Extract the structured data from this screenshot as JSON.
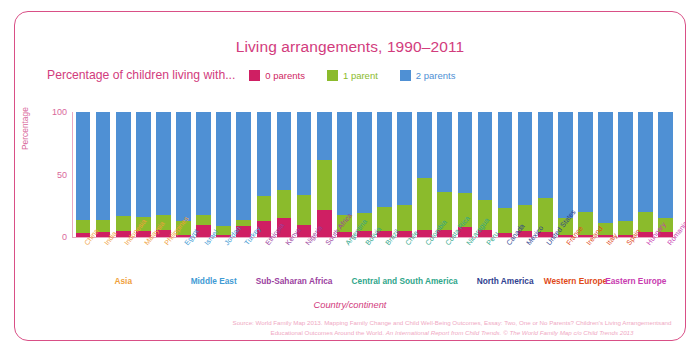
{
  "title": "Living arrangements, 1990–2011",
  "legend": {
    "label": "Percentage of children living with...",
    "items": [
      {
        "text": "0 parents",
        "color": "#cf1f63"
      },
      {
        "text": "1 parent",
        "color": "#8bbb2c"
      },
      {
        "text": "2 parents",
        "color": "#4f90d4"
      }
    ]
  },
  "axes": {
    "ylabel": "Percentage",
    "yticks": [
      "100",
      "50",
      "0"
    ],
    "xlabel": "Country/continent"
  },
  "groups": [
    {
      "label": "Asia",
      "color": "#f0a03c",
      "start": 0,
      "end": 4
    },
    {
      "label": "Middle East",
      "color": "#3f9bd4",
      "start": 5,
      "end": 8
    },
    {
      "label": "Sub-Saharan Africa",
      "color": "#9b3fa0",
      "start": 9,
      "end": 12
    },
    {
      "label": "Central and South America",
      "color": "#2fa68a",
      "start": 13,
      "end": 19
    },
    {
      "label": "North America",
      "color": "#2f3f8f",
      "start": 20,
      "end": 22
    },
    {
      "label": "Western Europe",
      "color": "#e04a18",
      "start": 23,
      "end": 26
    },
    {
      "label": "Eastern Europe",
      "color": "#c83cb0",
      "start": 27,
      "end": 28
    }
  ],
  "source": {
    "line1_a": "Source: World Family Map 2013. Mapping Family Change and Child Well-Being Outcomes, Essay: Two, One or No Parents? Children's Living Arrangementsand Educational Outcomes Around the World. ",
    "line1_b": "An International Report from Child Trends.",
    "line1_c": " © ",
    "line1_d": "The World Family Map c/o Child Trends 2013"
  },
  "chart_data": {
    "type": "bar",
    "subtype": "stacked-100",
    "title": "Living arrangements, 1990–2011",
    "xlabel": "Country/continent",
    "ylabel": "Percentage",
    "ylim": [
      0,
      100
    ],
    "yticks": [
      0,
      50,
      100
    ],
    "grid": false,
    "legend_position": "top",
    "categories": [
      "China",
      "India",
      "Indonesia",
      "Malaysia",
      "Philippines",
      "Egypt",
      "Israel",
      "Jordan",
      "Turkey",
      "Ethiopia",
      "Kenya",
      "Nigeria",
      "South Africa",
      "Argentina",
      "Bolivia",
      "Brazil",
      "Chile",
      "Colombia",
      "Costa Rica",
      "Nicaragua",
      "Peru",
      "Canada",
      "Mexico",
      "United States",
      "France",
      "Ireland",
      "Italy",
      "Spain",
      "Hungary",
      "Romania"
    ],
    "category_groups": [
      "Asia",
      "Asia",
      "Asia",
      "Asia",
      "Asia",
      "Middle East",
      "Middle East",
      "Middle East",
      "Middle East",
      "Sub-Saharan Africa",
      "Sub-Saharan Africa",
      "Sub-Saharan Africa",
      "Sub-Saharan Africa",
      "Central and South America",
      "Central and South America",
      "Central and South America",
      "Central and South America",
      "Central and South America",
      "Central and South America",
      "Central and South America",
      "Central and South America",
      "North America",
      "North America",
      "North America",
      "Western Europe",
      "Western Europe",
      "Western Europe",
      "Western Europe",
      "Eastern Europe",
      "Eastern Europe"
    ],
    "series": [
      {
        "name": "0 parents",
        "color": "#cf1f63",
        "values": [
          3,
          4,
          5,
          5,
          6,
          2,
          10,
          2,
          9,
          13,
          15,
          10,
          22,
          4,
          5,
          5,
          5,
          6,
          6,
          8,
          6,
          3,
          5,
          4,
          2,
          2,
          2,
          2,
          4,
          4
        ]
      },
      {
        "name": "1 parent",
        "color": "#8bbb2c",
        "values": [
          11,
          10,
          12,
          11,
          12,
          11,
          8,
          7,
          5,
          20,
          23,
          24,
          40,
          14,
          14,
          19,
          21,
          41,
          30,
          27,
          24,
          20,
          21,
          27,
          13,
          18,
          9,
          11,
          16,
          11
        ]
      },
      {
        "name": "2 parents",
        "color": "#4f90d4",
        "values": [
          86,
          86,
          83,
          84,
          82,
          87,
          82,
          91,
          86,
          67,
          62,
          66,
          38,
          82,
          81,
          76,
          74,
          53,
          64,
          65,
          70,
          77,
          74,
          69,
          85,
          80,
          89,
          87,
          80,
          85
        ]
      }
    ]
  }
}
